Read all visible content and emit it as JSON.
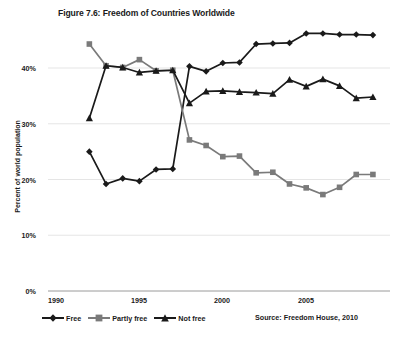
{
  "chart_data": {
    "type": "line",
    "title": "Figure 7.6: Freedom of Countries Worldwide",
    "xlabel": "",
    "ylabel": "Percent of world population",
    "xlim": [
      1990,
      2009
    ],
    "ylim": [
      0,
      48
    ],
    "x_ticks": [
      "1990",
      "1995",
      "2000",
      "2005"
    ],
    "x_tick_values": [
      1990,
      1995,
      2000,
      2005
    ],
    "y_ticks": [
      "0%",
      "10%",
      "20%",
      "30%",
      "40%"
    ],
    "y_tick_values": [
      0,
      10,
      20,
      30,
      40
    ],
    "grid": "horizontal",
    "legend_position": "bottom-left",
    "source": "Source: Freedom House, 2010",
    "x": [
      1992,
      1993,
      1994,
      1995,
      1996,
      1997,
      1998,
      1999,
      2000,
      2001,
      2002,
      2003,
      2004,
      2005,
      2006,
      2007,
      2008,
      2009
    ],
    "series": [
      {
        "name": "Free",
        "marker": "diamond",
        "color": "#1a1a1a",
        "values": [
          25.0,
          19.2,
          20.2,
          19.7,
          21.8,
          21.9,
          40.3,
          39.4,
          40.9,
          41.0,
          44.3,
          44.4,
          44.5,
          46.2,
          46.2,
          46.0,
          46.0,
          45.9
        ]
      },
      {
        "name": "Partly free",
        "marker": "square",
        "color": "#7a7a7a",
        "values": [
          44.3,
          40.4,
          40.1,
          41.5,
          39.5,
          39.6,
          27.1,
          26.1,
          24.1,
          24.2,
          21.2,
          21.3,
          19.2,
          18.5,
          17.3,
          18.6,
          20.9,
          20.9
        ]
      },
      {
        "name": "Not free",
        "marker": "triangle",
        "color": "#1a1a1a",
        "values": [
          31.0,
          40.4,
          40.1,
          39.2,
          39.5,
          39.6,
          33.7,
          35.8,
          35.9,
          35.7,
          35.6,
          35.4,
          37.9,
          36.7,
          38.0,
          36.8,
          34.6,
          34.8
        ]
      }
    ]
  },
  "legend": {
    "items": [
      {
        "label": "Free"
      },
      {
        "label": "Partly free"
      },
      {
        "label": "Not free"
      }
    ]
  }
}
